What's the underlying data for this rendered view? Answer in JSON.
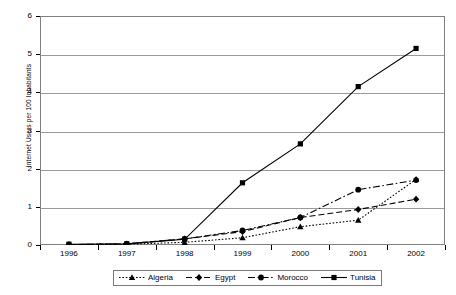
{
  "chart_data": {
    "type": "line",
    "title": "",
    "xlabel": "",
    "ylabel": "Internet Users per 100 Inhabitants",
    "categories": [
      "1996",
      "1997",
      "1998",
      "1999",
      "2000",
      "2001",
      "2002"
    ],
    "x": [
      1996,
      1997,
      1998,
      1999,
      2000,
      2001,
      2002
    ],
    "ylim": [
      0,
      6
    ],
    "yticks": [
      0,
      1,
      2,
      3,
      4,
      5,
      6
    ],
    "ytick_labels": [
      "0",
      "1",
      "2",
      "3",
      "4",
      "5",
      "6"
    ],
    "grid": true,
    "legend_position": "bottom",
    "series": [
      {
        "name": "Algeria",
        "values": [
          0.01,
          0.02,
          0.07,
          0.19,
          0.48,
          0.65,
          1.72
        ],
        "marker": "triangle",
        "line_style": "dotted",
        "color": "#000000"
      },
      {
        "name": "Egypt",
        "values": [
          0.01,
          0.03,
          0.16,
          0.35,
          0.72,
          0.93,
          1.2
        ],
        "marker": "diamond",
        "line_style": "dashed",
        "color": "#000000"
      },
      {
        "name": "Morocco",
        "values": [
          0.01,
          0.03,
          0.16,
          0.38,
          0.72,
          1.45,
          1.7
        ],
        "marker": "circle",
        "line_style": "dash-dot",
        "color": "#000000"
      },
      {
        "name": "Tunisia",
        "values": [
          0.02,
          0.03,
          0.15,
          1.63,
          2.65,
          4.15,
          5.15
        ],
        "marker": "square",
        "line_style": "solid",
        "color": "#000000"
      }
    ]
  },
  "axes": {
    "y_title": "Internet Users per 100 Inhabitants"
  },
  "legend": {
    "items": [
      {
        "label": "Algeria"
      },
      {
        "label": "Egypt"
      },
      {
        "label": "Morocco"
      },
      {
        "label": "Tunisia"
      }
    ]
  },
  "colors": {
    "frame": "#808080",
    "grid": "#9a9a9a",
    "series": "#000000",
    "background": "#ffffff"
  }
}
